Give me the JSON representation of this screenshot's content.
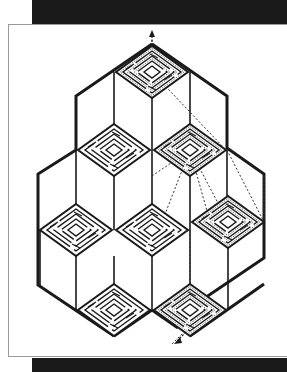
{
  "figure": {
    "title": "",
    "colors": {
      "line": "#1a1a1a",
      "background": "#ffffff",
      "band": "#1a1a1a",
      "panel_border": "#9a9a9a",
      "path": "#333333"
    },
    "mazes": [
      {
        "id": "top",
        "cx": 152,
        "cy": 72,
        "solved": true
      },
      {
        "id": "upper-left",
        "cx": 114,
        "cy": 150,
        "solved": false
      },
      {
        "id": "upper-right",
        "cx": 190,
        "cy": 150,
        "solved": true
      },
      {
        "id": "right",
        "cx": 228,
        "cy": 222,
        "solved": true
      },
      {
        "id": "left",
        "cx": 76,
        "cy": 230,
        "solved": false
      },
      {
        "id": "center",
        "cx": 152,
        "cy": 230,
        "solved": false
      },
      {
        "id": "bottom-left",
        "cx": 114,
        "cy": 310,
        "solved": false
      },
      {
        "id": "bottom-right",
        "cx": 190,
        "cy": 310,
        "solved": true
      }
    ],
    "arrows": {
      "exit": "up",
      "entry": "down-left"
    }
  }
}
